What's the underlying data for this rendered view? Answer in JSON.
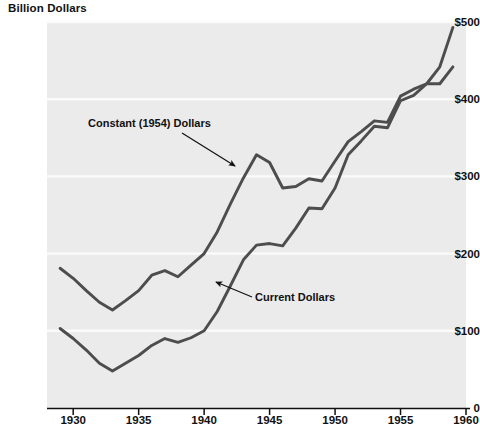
{
  "chart_data": {
    "type": "line",
    "title": "Billion Dollars",
    "xlabel": "",
    "ylabel": "Billion Dollars",
    "xlim": [
      1928,
      1960
    ],
    "ylim": [
      0,
      500
    ],
    "xticks": [
      1930,
      1935,
      1940,
      1945,
      1950,
      1955,
      1960
    ],
    "xtick_labels": [
      "1930",
      "1935",
      "1940",
      "1945",
      "1950",
      "1955",
      "1960"
    ],
    "yticks": [
      0,
      100,
      200,
      300,
      400,
      500
    ],
    "ytick_labels": [
      "0",
      "$100",
      "$200",
      "$300",
      "$400",
      "$500"
    ],
    "grid": "horizontal-white",
    "legend": "inline-annotations",
    "x": [
      1929,
      1930,
      1931,
      1932,
      1933,
      1934,
      1935,
      1936,
      1937,
      1938,
      1939,
      1940,
      1941,
      1942,
      1943,
      1944,
      1945,
      1946,
      1947,
      1948,
      1949,
      1950,
      1951,
      1952,
      1953,
      1954,
      1955,
      1956,
      1957,
      1958,
      1959
    ],
    "series": [
      {
        "name": "Constant (1954) Dollars",
        "color": "#4d4d4d",
        "values": [
          181,
          168,
          152,
          137,
          127,
          139,
          152,
          172,
          178,
          170,
          185,
          200,
          228,
          264,
          298,
          328,
          318,
          285,
          287,
          297,
          294,
          320,
          345,
          358,
          372,
          370,
          404,
          413,
          420,
          442,
          493
        ]
      },
      {
        "name": "Current Dollars",
        "color": "#4d4d4d",
        "values": [
          103,
          90,
          75,
          58,
          48,
          58,
          68,
          81,
          90,
          85,
          91,
          100,
          125,
          158,
          192,
          211,
          213,
          210,
          233,
          259,
          258,
          285,
          328,
          346,
          365,
          363,
          398,
          405,
          420,
          420,
          442
        ]
      }
    ],
    "annotations": [
      {
        "text": "Constant (1954) Dollars",
        "points_to_series": "Constant (1954) Dollars",
        "arrow_from": [
          182,
          133
        ],
        "arrow_to": [
          235,
          166
        ]
      },
      {
        "text": "Current Dollars",
        "points_to_series": "Current Dollars",
        "arrow_from": [
          252,
          297
        ],
        "arrow_to": [
          216,
          282
        ]
      }
    ]
  },
  "colors": {
    "plot_background": "#ebebeb",
    "gridline": "#fbfbfb",
    "line": "#4d4d4d",
    "axis": "#111111",
    "text": "#111111",
    "page_background": "#ffffff"
  },
  "geometry": {
    "plot_left": 47,
    "plot_right": 466,
    "plot_top": 22,
    "plot_bottom": 408
  }
}
